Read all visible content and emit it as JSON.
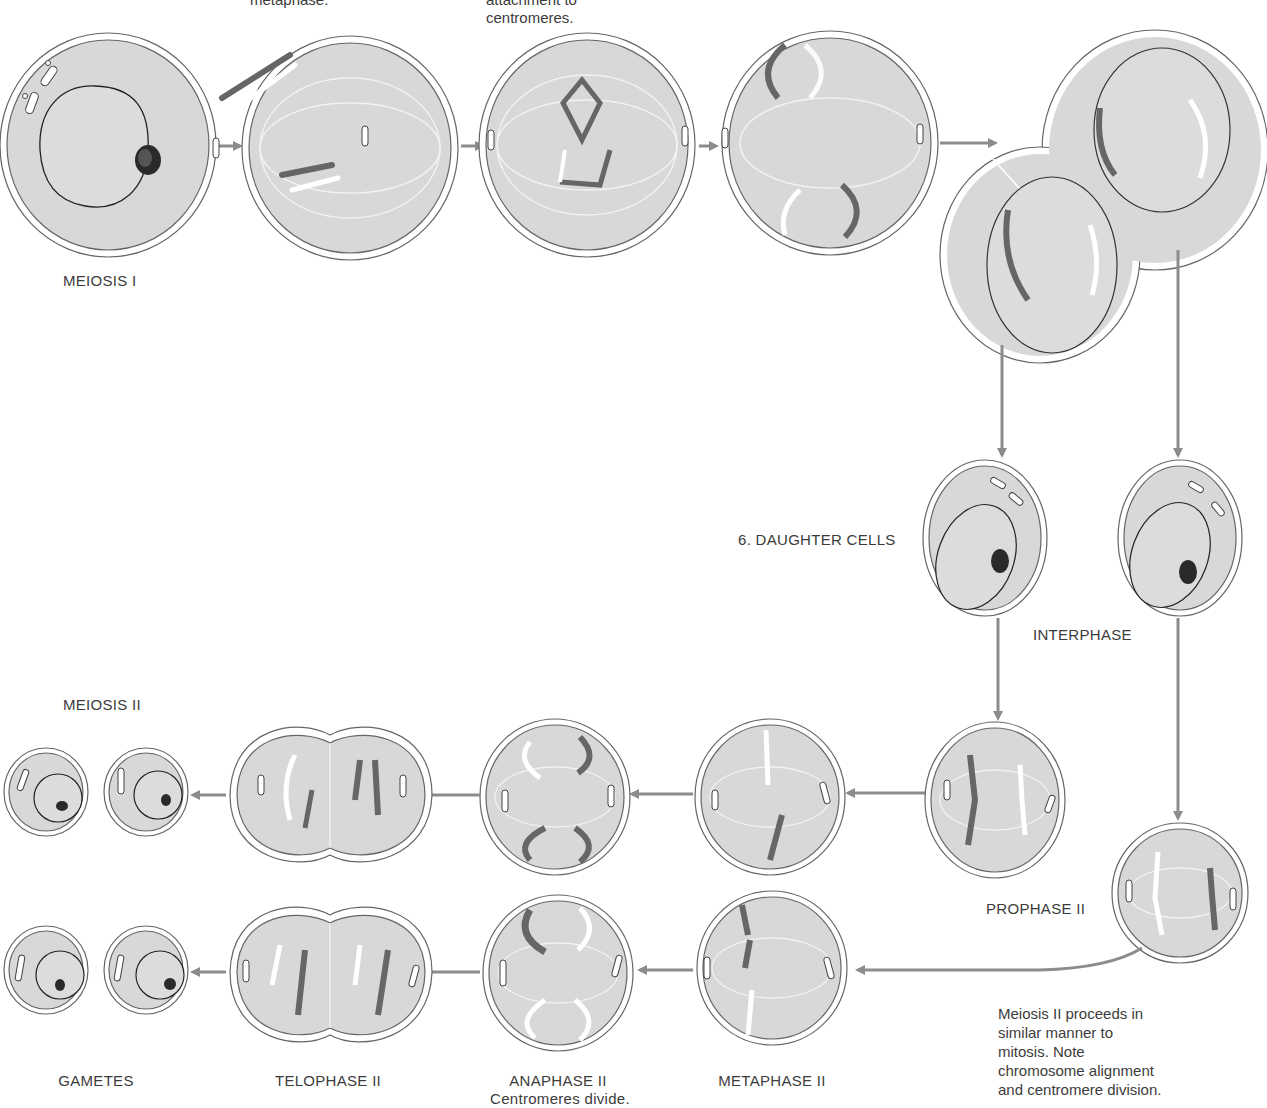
{
  "diagram": {
    "title_top_fragments": {
      "metaphase_fragment": "metaphase.",
      "attachment_fragment_line1": "attachment to",
      "attachment_fragment_line2": "centromeres."
    },
    "section_labels": {
      "meiosis_1": "MEIOSIS I",
      "meiosis_2": "MEIOSIS II"
    },
    "stage_labels": {
      "daughter_cells": "6.  DAUGHTER CELLS",
      "interphase": "INTERPHASE",
      "prophase_2": "PROPHASE II",
      "metaphase_2": "METAPHASE II",
      "anaphase_2": "ANAPHASE II",
      "anaphase_2_sub": "Centromeres divide.",
      "telophase_2": "TELOPHASE II",
      "gametes": "GAMETES"
    },
    "note": {
      "lines": [
        "Meiosis II proceeds in",
        "similar manner to",
        "mitosis. Note",
        "chromosome alignment",
        "and centromere division."
      ]
    },
    "colors": {
      "cell_fill": "#d8d8d8",
      "membrane_stroke": "#555555",
      "arrow": "#8c8c8c",
      "chromosome_dark": "#6e6e6e",
      "chromosome_light": "#ffffff",
      "spindle": "#f2f2f2"
    },
    "flow": [
      "Meiosis I interphase cell",
      "Meiosis I metaphase (homolog pairs)",
      "Spindle attachment to centromeres",
      "Anaphase I",
      "Telophase I (two cells)",
      "6. Daughter cells / Interphase",
      "Prophase II",
      "Metaphase II",
      "Anaphase II - Centromeres divide",
      "Telophase II",
      "Gametes"
    ]
  }
}
